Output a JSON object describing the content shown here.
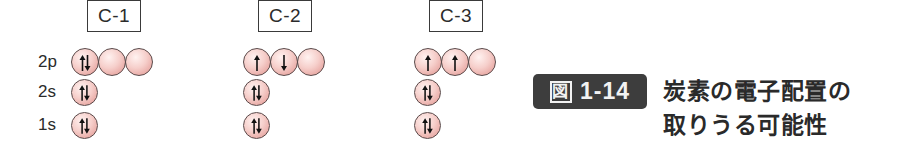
{
  "figure": {
    "number_prefix": "図",
    "number": "1-14",
    "title_line1": "炭素の電子配置の",
    "title_line2": "取りうる可能性"
  },
  "orbital_labels": [
    "2p",
    "2s",
    "1s"
  ],
  "colors": {
    "orbital_fill_center": "#fff2f0",
    "orbital_fill_edge": "#e6a39e",
    "orbital_outline": "#5a4a4a",
    "badge_bg": "#3d3d3d",
    "text": "#2a2a2a"
  },
  "configurations": [
    {
      "label": "C-1",
      "orbitals": {
        "2p": [
          "up-down",
          "empty",
          "empty"
        ],
        "2s": [
          "up-down"
        ],
        "1s": [
          "up-down"
        ]
      }
    },
    {
      "label": "C-2",
      "orbitals": {
        "2p": [
          "up",
          "down",
          "empty"
        ],
        "2s": [
          "up-down"
        ],
        "1s": [
          "up-down"
        ]
      }
    },
    {
      "label": "C-3",
      "orbitals": {
        "2p": [
          "up",
          "up",
          "empty"
        ],
        "2s": [
          "up-down"
        ],
        "1s": [
          "up-down"
        ]
      }
    }
  ]
}
